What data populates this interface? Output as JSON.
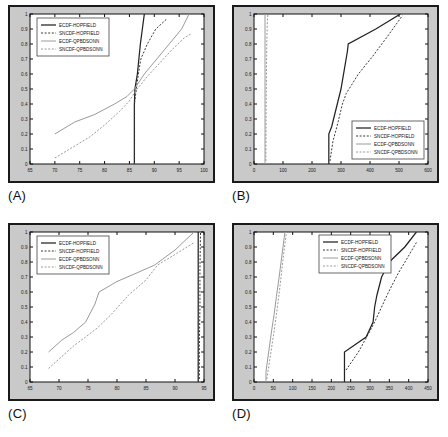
{
  "figure": {
    "background": "#ffffff",
    "panel_frame_color": "#c9c9c9",
    "panel_border_color": "#1a1a1a"
  },
  "series_style": {
    "ECDF-HOPFIELD": {
      "color": "#232323",
      "dash": "none",
      "width": 1.25
    },
    "SNCDF-HOPFIELD": {
      "color": "#3a3a3a",
      "dash": "2,1.6",
      "width": 1.0
    },
    "ECDF-QPBDSONN": {
      "color": "#9a9a9a",
      "dash": "none",
      "width": 1.0
    },
    "SNCDF-QPBDSONN": {
      "color": "#9a9a9a",
      "dash": "2,1.6",
      "width": 1.0
    }
  },
  "legend_labels": [
    "ECDF-HOPFIELD",
    "SNCDF-HOPFIELD",
    "ECDF-QPBDSONN",
    "SNCDF-QPBDSONN"
  ],
  "panels": [
    {
      "key": "A",
      "label": "(A)",
      "legend_position": "top-left"
    },
    {
      "key": "B",
      "label": "(B)",
      "legend_position": "bottom-right"
    },
    {
      "key": "C",
      "label": "(C)",
      "legend_position": "top-left"
    },
    {
      "key": "D",
      "label": "(D)",
      "legend_position": "top-center"
    }
  ],
  "chart_data": [
    {
      "panel": "A",
      "type": "line",
      "title": "",
      "xlabel": "",
      "ylabel": "",
      "xlim": [
        65,
        100
      ],
      "ylim": [
        0,
        1
      ],
      "xticks": [
        65,
        70,
        75,
        80,
        85,
        90,
        95,
        100
      ],
      "yticks": [
        0,
        0.1,
        0.2,
        0.3,
        0.4,
        0.5,
        0.6,
        0.7,
        0.8,
        0.9,
        1
      ],
      "grid": false,
      "legend": [
        "ECDF-HOPFIELD",
        "SNCDF-HOPFIELD",
        "ECDF-QPBDSONN",
        "SNCDF-QPBDSONN"
      ],
      "series": [
        {
          "name": "ECDF-HOPFIELD",
          "points": [
            [
              86,
              0
            ],
            [
              86,
              0.2
            ],
            [
              86,
              0.4
            ],
            [
              86.1,
              0.5
            ],
            [
              86.6,
              0.6
            ],
            [
              86.9,
              0.7
            ],
            [
              87.2,
              0.8
            ],
            [
              87.6,
              0.9
            ],
            [
              88,
              1
            ]
          ]
        },
        {
          "name": "SNCDF-HOPFIELD",
          "points": [
            [
              86,
              0
            ],
            [
              86,
              0.1
            ],
            [
              86,
              0.2
            ],
            [
              86,
              0.3
            ],
            [
              86,
              0.4
            ],
            [
              86.2,
              0.45
            ],
            [
              86.4,
              0.5
            ],
            [
              86.8,
              0.6
            ],
            [
              87.3,
              0.7
            ],
            [
              88.6,
              0.8
            ],
            [
              90.3,
              0.9
            ],
            [
              92.6,
              0.97
            ]
          ]
        },
        {
          "name": "ECDF-QPBDSONN",
          "points": [
            [
              70,
              0.2
            ],
            [
              74,
              0.28
            ],
            [
              78,
              0.33
            ],
            [
              82,
              0.4
            ],
            [
              84.5,
              0.45
            ],
            [
              86,
              0.5
            ],
            [
              88,
              0.6
            ],
            [
              90.5,
              0.7
            ],
            [
              93,
              0.8
            ],
            [
              95.5,
              0.9
            ],
            [
              97,
              1
            ]
          ]
        },
        {
          "name": "SNCDF-QPBDSONN",
          "points": [
            [
              70,
              0.04
            ],
            [
              73,
              0.1
            ],
            [
              77,
              0.18
            ],
            [
              80,
              0.26
            ],
            [
              83,
              0.35
            ],
            [
              85,
              0.42
            ],
            [
              86.3,
              0.49
            ],
            [
              88.5,
              0.58
            ],
            [
              91,
              0.67
            ],
            [
              93.5,
              0.76
            ],
            [
              96,
              0.84
            ],
            [
              97.5,
              0.87
            ]
          ]
        }
      ]
    },
    {
      "panel": "B",
      "type": "line",
      "title": "",
      "xlabel": "",
      "ylabel": "",
      "xlim": [
        0,
        600
      ],
      "ylim": [
        0,
        1
      ],
      "xticks": [
        0,
        100,
        200,
        300,
        400,
        500,
        600
      ],
      "yticks": [
        0,
        0.1,
        0.2,
        0.3,
        0.4,
        0.5,
        0.6,
        0.7,
        0.8,
        0.9,
        1
      ],
      "grid": false,
      "legend": [
        "ECDF-HOPFIELD",
        "SNCDF-HOPFIELD",
        "ECDF-QPBDSONN",
        "SNCDF-QPBDSONN"
      ],
      "series": [
        {
          "name": "ECDF-HOPFIELD",
          "points": [
            [
              258,
              0
            ],
            [
              258,
              0.2
            ],
            [
              268,
              0.25
            ],
            [
              300,
              0.5
            ],
            [
              322,
              0.75
            ],
            [
              325,
              0.8
            ],
            [
              420,
              0.9
            ],
            [
              505,
              1
            ]
          ]
        },
        {
          "name": "SNCDF-HOPFIELD",
          "points": [
            [
              262,
              0.02
            ],
            [
              272,
              0.15
            ],
            [
              286,
              0.25
            ],
            [
              305,
              0.4
            ],
            [
              318,
              0.47
            ],
            [
              360,
              0.6
            ],
            [
              410,
              0.72
            ],
            [
              460,
              0.85
            ],
            [
              512,
              0.99
            ]
          ]
        },
        {
          "name": "ECDF-QPBDSONN",
          "points": [
            [
              38,
              0
            ],
            [
              38,
              0.2
            ],
            [
              38,
              0.4
            ],
            [
              38,
              0.6
            ],
            [
              38,
              0.8
            ],
            [
              38,
              1
            ]
          ]
        },
        {
          "name": "SNCDF-QPBDSONN",
          "points": [
            [
              41,
              0.02
            ],
            [
              41.5,
              0.2
            ],
            [
              42,
              0.4
            ],
            [
              43,
              0.6
            ],
            [
              44,
              0.8
            ],
            [
              46,
              0.95
            ],
            [
              48,
              1
            ]
          ]
        }
      ]
    },
    {
      "panel": "C",
      "type": "line",
      "title": "",
      "xlabel": "",
      "ylabel": "",
      "xlim": [
        65,
        95
      ],
      "ylim": [
        0,
        1
      ],
      "xticks": [
        65,
        70,
        75,
        80,
        85,
        90,
        95
      ],
      "yticks": [
        0,
        0.1,
        0.2,
        0.3,
        0.4,
        0.5,
        0.6,
        0.7,
        0.8,
        0.9,
        1
      ],
      "grid": false,
      "legend": [
        "ECDF-HOPFIELD",
        "SNCDF-HOPFIELD",
        "ECDF-QPBDSONN",
        "SNCDF-QPBDSONN"
      ],
      "series": [
        {
          "name": "ECDF-HOPFIELD",
          "points": [
            [
              94,
              0
            ],
            [
              94,
              0.2
            ],
            [
              94,
              0.4
            ],
            [
              94,
              0.6
            ],
            [
              94,
              0.8
            ],
            [
              94,
              1
            ]
          ]
        },
        {
          "name": "SNCDF-HOPFIELD",
          "points": [
            [
              94.2,
              0.02
            ],
            [
              94.2,
              0.25
            ],
            [
              94.3,
              0.5
            ],
            [
              94.3,
              0.75
            ],
            [
              94.4,
              1
            ]
          ]
        },
        {
          "name": "ECDF-QPBDSONN",
          "points": [
            [
              68.2,
              0.2
            ],
            [
              70.5,
              0.28
            ],
            [
              72.5,
              0.33
            ],
            [
              74.6,
              0.4
            ],
            [
              76.2,
              0.52
            ],
            [
              76.9,
              0.6
            ],
            [
              80,
              0.67
            ],
            [
              83,
              0.72
            ],
            [
              86.5,
              0.78
            ],
            [
              90,
              0.88
            ],
            [
              93.3,
              1
            ]
          ]
        },
        {
          "name": "SNCDF-QPBDSONN",
          "points": [
            [
              68.2,
              0.09
            ],
            [
              70.5,
              0.17
            ],
            [
              72.5,
              0.24
            ],
            [
              74.6,
              0.3
            ],
            [
              76.6,
              0.36
            ],
            [
              79,
              0.45
            ],
            [
              82,
              0.58
            ],
            [
              85,
              0.68
            ],
            [
              87,
              0.78
            ],
            [
              90,
              0.85
            ],
            [
              93.3,
              0.93
            ]
          ]
        }
      ]
    },
    {
      "panel": "D",
      "type": "line",
      "title": "",
      "xlabel": "",
      "ylabel": "",
      "xlim": [
        0,
        450
      ],
      "ylim": [
        0,
        1
      ],
      "xticks": [
        0,
        50,
        100,
        150,
        200,
        250,
        300,
        350,
        400,
        450
      ],
      "yticks": [
        0,
        0.1,
        0.2,
        0.3,
        0.4,
        0.5,
        0.6,
        0.7,
        0.8,
        0.9,
        1
      ],
      "grid": false,
      "legend": [
        "ECDF-HOPFIELD",
        "SNCDF-HOPFIELD",
        "ECDF-QPBDSONN",
        "SNCDF-QPBDSONN"
      ],
      "series": [
        {
          "name": "ECDF-HOPFIELD",
          "points": [
            [
              234,
              0
            ],
            [
              234,
              0.2
            ],
            [
              290,
              0.3
            ],
            [
              308,
              0.4
            ],
            [
              312,
              0.5
            ],
            [
              318,
              0.58
            ],
            [
              330,
              0.7
            ],
            [
              350,
              0.8
            ],
            [
              390,
              0.9
            ],
            [
              420,
              1
            ]
          ]
        },
        {
          "name": "SNCDF-HOPFIELD",
          "points": [
            [
              238,
              0.08
            ],
            [
              270,
              0.2
            ],
            [
              300,
              0.34
            ],
            [
              312,
              0.4
            ],
            [
              330,
              0.5
            ],
            [
              348,
              0.6
            ],
            [
              372,
              0.72
            ],
            [
              395,
              0.82
            ],
            [
              420,
              0.93
            ]
          ]
        },
        {
          "name": "ECDF-QPBDSONN",
          "points": [
            [
              31,
              0
            ],
            [
              31,
              0.07
            ],
            [
              38,
              0.2
            ],
            [
              46,
              0.35
            ],
            [
              52,
              0.45
            ],
            [
              58,
              0.57
            ],
            [
              64,
              0.68
            ],
            [
              70,
              0.8
            ],
            [
              76,
              0.92
            ],
            [
              80,
              1
            ]
          ]
        },
        {
          "name": "SNCDF-QPBDSONN",
          "points": [
            [
              33,
              0.02
            ],
            [
              38,
              0.1
            ],
            [
              45,
              0.22
            ],
            [
              52,
              0.34
            ],
            [
              58,
              0.45
            ],
            [
              64,
              0.57
            ],
            [
              70,
              0.7
            ],
            [
              76,
              0.84
            ],
            [
              82,
              0.96
            ],
            [
              84,
              1
            ]
          ]
        }
      ]
    }
  ]
}
